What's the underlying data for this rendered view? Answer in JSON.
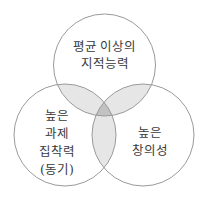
{
  "diagram": {
    "type": "venn-3",
    "colors": {
      "background": "#ffffff",
      "outline": "#9a9a9a",
      "pair_overlap": "#e6e6e6",
      "triple_overlap": "#c2c2c2",
      "text": "#3a3a3a"
    },
    "circles": [
      {
        "id": "intelligence",
        "label_lines": [
          "평균 이상의",
          "지적능력"
        ]
      },
      {
        "id": "task-commitment",
        "label_lines": [
          "높은",
          "과제",
          "집착력",
          "(동기)"
        ]
      },
      {
        "id": "creativity",
        "label_lines": [
          "높은",
          "창의성"
        ]
      }
    ]
  }
}
